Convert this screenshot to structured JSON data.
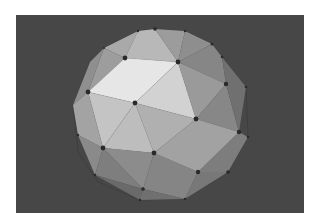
{
  "image": {
    "subject": "Shaded geodesic polyhedron (icosphere) with vertex markers",
    "colors": {
      "frame": "#ffffff",
      "background": "#474747",
      "vertex": "#2a2a2a",
      "edge_back": "#3a3a3a"
    }
  }
}
